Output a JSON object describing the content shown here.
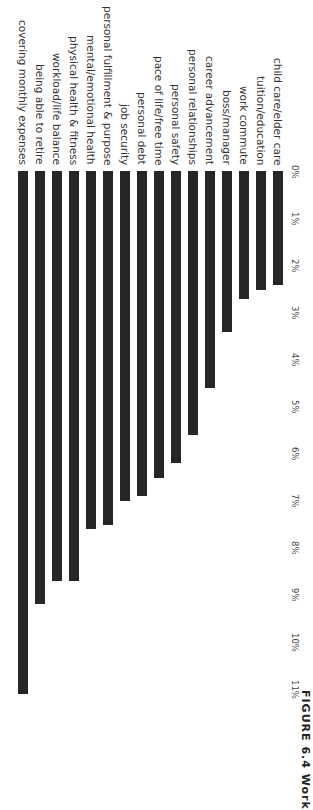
{
  "chart_data": {
    "type": "bar",
    "orientation": "rotated-90-horizontal-bars",
    "title": "",
    "xlabel": "",
    "ylabel": "",
    "categories": [
      "covering monthly expenses",
      "being able to retire",
      "workload/life balance",
      "physical health & fitness",
      "mental/emotional health",
      "personal fulfillment & purpose",
      "job security",
      "personal debt",
      "pace of life/free time",
      "personal safety",
      "personal relationships",
      "career advancement",
      "boss/manager",
      "work commute",
      "tuition/education",
      "child care/elder care"
    ],
    "values": [
      11.1,
      9.2,
      8.7,
      8.7,
      7.6,
      7.5,
      7.0,
      6.9,
      6.5,
      6.2,
      5.6,
      4.6,
      3.4,
      2.7,
      2.5,
      2.4
    ],
    "value_unit": "%",
    "ticks": [
      "0%",
      "1%",
      "2%",
      "3%",
      "4%",
      "5%",
      "6%",
      "7%",
      "8%",
      "9%",
      "10%",
      "11%"
    ],
    "value_range": [
      0,
      11
    ],
    "grid": false,
    "legend": "none",
    "bar_color": "#262626"
  },
  "caption": {
    "text": "FIGURE 6.4  Work"
  }
}
